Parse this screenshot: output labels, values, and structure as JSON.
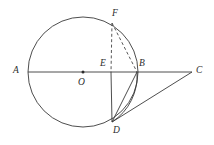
{
  "figure": {
    "kind": "plane-geometry-diagram",
    "stroke_color": "#3a3a3a",
    "label_color": "#2b2b2b",
    "background_color": "#ffffff",
    "width": 214,
    "height": 145
  },
  "circle": {
    "name": "main-circle",
    "center_x": 83,
    "center_y": 72,
    "radius": 55,
    "center_label": "O"
  },
  "points": [
    {
      "id": "A",
      "label": "A",
      "x": 28,
      "y": 72,
      "label_x": 13,
      "label_y": 66
    },
    {
      "id": "O",
      "label": "O",
      "x": 83,
      "y": 72,
      "label_x": 78,
      "label_y": 78
    },
    {
      "id": "E",
      "label": "E",
      "x": 111,
      "y": 72,
      "label_x": 100,
      "label_y": 59
    },
    {
      "id": "B",
      "label": "B",
      "x": 137,
      "y": 72,
      "label_x": 139,
      "label_y": 59
    },
    {
      "id": "C",
      "label": "C",
      "x": 192,
      "y": 72,
      "label_x": 196,
      "label_y": 66
    },
    {
      "id": "F",
      "label": "F",
      "x": 112,
      "y": 23,
      "label_x": 112,
      "label_y": 9
    },
    {
      "id": "D",
      "label": "D",
      "x": 112,
      "y": 122,
      "label_x": 113,
      "label_y": 126
    }
  ],
  "segments": [
    {
      "id": "AC",
      "name": "segment-a-c",
      "from": "A",
      "to": "C",
      "style": "solid"
    },
    {
      "id": "ED",
      "name": "segment-e-d",
      "from": "E",
      "to": "D",
      "style": "solid"
    },
    {
      "id": "DB",
      "name": "segment-d-b",
      "from": "D",
      "to": "B",
      "style": "solid"
    },
    {
      "id": "DC",
      "name": "segment-d-c",
      "from": "D",
      "to": "C",
      "style": "solid"
    },
    {
      "id": "FE",
      "name": "segment-f-e",
      "from": "F",
      "to": "E",
      "style": "dashed"
    },
    {
      "id": "FB",
      "name": "segment-f-b",
      "from": "F",
      "to": "B",
      "style": "dashed"
    }
  ],
  "arcs": [
    {
      "id": "arc-BD",
      "name": "arc-b-d",
      "from": "B",
      "to": "D",
      "bulge": "right"
    }
  ]
}
